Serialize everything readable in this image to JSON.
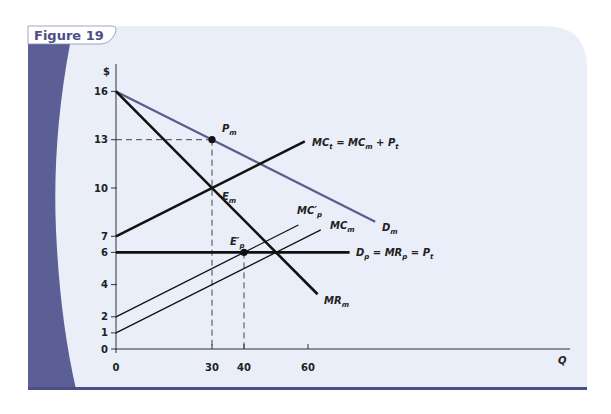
{
  "figure": {
    "title": "Figure 19",
    "colors": {
      "panel_bg": "#e9eef8",
      "accent_band": "#5b5f95",
      "title_text": "#4a4f86",
      "demand_line": "#5a5c8e",
      "black_line": "#111111"
    }
  },
  "chart_data": {
    "type": "line",
    "title": "Figure 19",
    "xlabel": "Q",
    "ylabel": "$",
    "xlim": [
      0,
      125
    ],
    "ylim": [
      0,
      17
    ],
    "x_ticks": [
      0,
      30,
      40,
      60
    ],
    "y_ticks": [
      0,
      1,
      2,
      4,
      6,
      7,
      10,
      13,
      16
    ],
    "grid": false,
    "series": [
      {
        "name": "D_m",
        "label": "D",
        "sub": "m",
        "color": "#5a5c8e",
        "width": 2.2,
        "points": [
          [
            0,
            16
          ],
          [
            81,
            7.9
          ]
        ]
      },
      {
        "name": "MR_m",
        "label": "MR",
        "sub": "m",
        "color": "#111111",
        "width": 2.6,
        "points": [
          [
            0,
            16
          ],
          [
            63,
            3.4
          ]
        ]
      },
      {
        "name": "MC_t = MC_m + P_t",
        "label": "MC",
        "sub": "t",
        "suffix": " = MC",
        "suffix_sub": "m",
        "suffix2": " + P",
        "suffix2_sub": "t",
        "color": "#111111",
        "width": 2.6,
        "points": [
          [
            0,
            7
          ],
          [
            59,
            12.9
          ]
        ]
      },
      {
        "name": "D_p = MR_p = P_t",
        "label": "D",
        "sub": "p",
        "suffix": " = MR",
        "suffix_sub": "p",
        "suffix2": " = P",
        "suffix2_sub": "t",
        "color": "#111111",
        "width": 2.6,
        "points": [
          [
            0,
            6
          ],
          [
            73,
            6
          ]
        ]
      },
      {
        "name": "MC'_p",
        "label": "MC′",
        "sub": "p",
        "color": "#111111",
        "width": 1.3,
        "points": [
          [
            0,
            2
          ],
          [
            57,
            7.7
          ]
        ]
      },
      {
        "name": "MC_m",
        "label": "MC",
        "sub": "m",
        "color": "#111111",
        "width": 1.3,
        "points": [
          [
            0,
            1
          ],
          [
            64,
            7.4
          ]
        ]
      }
    ],
    "annotations": [
      {
        "name": "P_m",
        "label": "P",
        "sub": "m",
        "x": 30,
        "y": 13,
        "dot": true
      },
      {
        "name": "E_m",
        "label": "E",
        "sub": "m",
        "x": 30,
        "y": 10,
        "dot": false
      },
      {
        "name": "E'_p",
        "label": "E′",
        "sub": "p",
        "x": 40,
        "y": 6,
        "dot": true
      }
    ],
    "guides": [
      {
        "from": [
          0,
          13
        ],
        "to": [
          30,
          13
        ]
      },
      {
        "from": [
          30,
          13
        ],
        "to": [
          30,
          0
        ]
      },
      {
        "from": [
          40,
          6
        ],
        "to": [
          40,
          0
        ]
      }
    ]
  }
}
